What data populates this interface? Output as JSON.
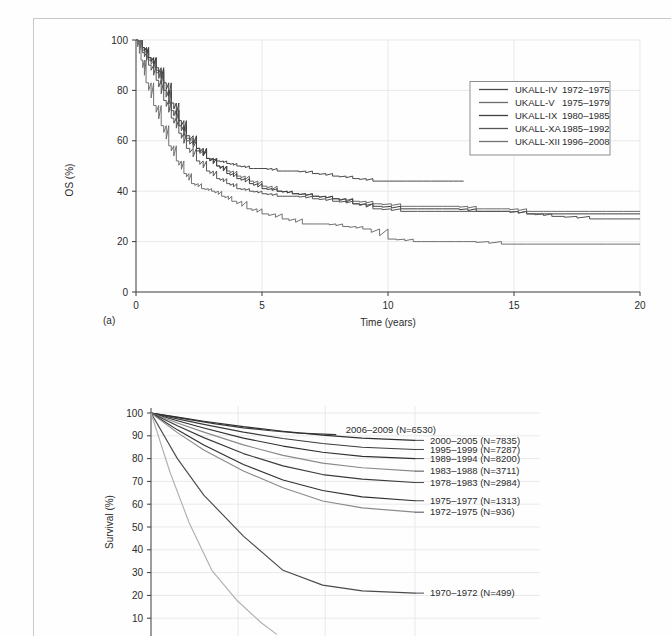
{
  "page": {
    "background": "#fefefe",
    "border_color": "#c9c9c9"
  },
  "figure_a": {
    "panel_label": "(a)",
    "xlabel": "Time (years)",
    "ylabel": "OS (%)",
    "legend": {
      "entries": [
        {
          "trial": "UKALL-IV",
          "period": "1972–1975",
          "color": "#4a4a4a"
        },
        {
          "trial": "UKALL-V",
          "period": "1975–1979",
          "color": "#6b6b6b"
        },
        {
          "trial": "UKALL-IX",
          "period": "1980–1985",
          "color": "#3f3f3f"
        },
        {
          "trial": "UKALL-XA",
          "period": "1985–1992",
          "color": "#555555"
        },
        {
          "trial": "UKALL-XII",
          "period": "1996–2008",
          "color": "#717171"
        }
      ]
    },
    "chart_data": {
      "type": "line",
      "title": "",
      "xlabel": "Time (years)",
      "ylabel": "OS (%)",
      "xlim": [
        0,
        20
      ],
      "ylim": [
        0,
        100
      ],
      "xticks": [
        0,
        5,
        10,
        15,
        20
      ],
      "yticks": [
        0,
        20,
        40,
        60,
        80,
        100
      ],
      "grid": "y-major-light",
      "legend_position": "upper-right",
      "series": [
        {
          "name": "UKALL-IV 1972–1975",
          "color": "#4a4a4a",
          "step": true,
          "x": [
            0,
            0.25,
            0.5,
            0.8,
            1.1,
            1.4,
            1.7,
            2.0,
            2.4,
            2.8,
            3.2,
            3.6,
            4.0,
            4.5,
            5.0,
            5.6,
            6.2,
            7.0,
            7.8,
            8.6,
            9.4,
            10.4,
            11.4,
            12.4,
            13.0
          ],
          "y": [
            100,
            97,
            93,
            88,
            80,
            72,
            66,
            60,
            56,
            53,
            52,
            51,
            50,
            49,
            49,
            48,
            48,
            47,
            46,
            45,
            44,
            44,
            44,
            44,
            44
          ]
        },
        {
          "name": "UKALL-V 1975–1979",
          "color": "#6b6b6b",
          "step": true,
          "x": [
            0,
            0.25,
            0.5,
            0.8,
            1.1,
            1.4,
            1.7,
            2.0,
            2.4,
            2.8,
            3.2,
            3.6,
            4.0,
            4.5,
            5.0,
            5.6,
            6.2,
            7.0,
            7.8,
            8.6,
            9.4,
            10.5,
            11.5,
            12.5,
            13.5,
            14.5,
            15.5,
            16.5,
            18.0,
            20.0
          ],
          "y": [
            100,
            96,
            92,
            87,
            80,
            72,
            66,
            61,
            57,
            53,
            50,
            48,
            46,
            44,
            42,
            40,
            39,
            38,
            37,
            36,
            35,
            34,
            34,
            34,
            33,
            33,
            32,
            32,
            32,
            32
          ]
        },
        {
          "name": "UKALL-IX 1980–1985",
          "color": "#3f3f3f",
          "step": true,
          "x": [
            0,
            0.25,
            0.5,
            0.8,
            1.1,
            1.4,
            1.7,
            2.0,
            2.4,
            2.8,
            3.2,
            3.6,
            4.0,
            4.5,
            5.0,
            5.6,
            6.2,
            7.0,
            7.8,
            8.6,
            9.4,
            10.5,
            11.5,
            12.5,
            13.5,
            14.5,
            15.5,
            16.5,
            18.0,
            20.0
          ],
          "y": [
            100,
            97,
            93,
            89,
            83,
            75,
            68,
            62,
            57,
            53,
            50,
            47,
            45,
            43,
            41,
            40,
            39,
            38,
            37,
            35,
            34,
            33,
            33,
            33,
            32,
            32,
            31,
            31,
            31,
            31
          ]
        },
        {
          "name": "UKALL-XA 1985–1992",
          "color": "#555555",
          "step": true,
          "x": [
            0,
            0.25,
            0.5,
            0.8,
            1.1,
            1.4,
            1.7,
            2.0,
            2.4,
            2.8,
            3.2,
            3.6,
            4.0,
            4.5,
            5.0,
            5.6,
            6.2,
            7.0,
            7.8,
            8.6,
            9.4,
            10.5,
            11.5,
            12.5,
            13.5,
            14.5,
            15.5,
            16.5,
            18.0,
            20.0
          ],
          "y": [
            100,
            95,
            90,
            84,
            76,
            69,
            63,
            57,
            52,
            48,
            45,
            43,
            41,
            40,
            39,
            38,
            38,
            37,
            36,
            35,
            33,
            32,
            32,
            32,
            32,
            32,
            31,
            30,
            29,
            29
          ]
        },
        {
          "name": "UKALL-XII 1996–2008",
          "color": "#717171",
          "step": true,
          "x": [
            0,
            0.2,
            0.4,
            0.7,
            1.0,
            1.3,
            1.6,
            1.9,
            2.2,
            2.6,
            3.0,
            3.4,
            3.8,
            4.4,
            5.0,
            5.8,
            6.6,
            7.4,
            8.2,
            9.0,
            10.0,
            11.0,
            12.0,
            13.0,
            14.5,
            16.0,
            18.0,
            20.0
          ],
          "y": [
            100,
            92,
            83,
            74,
            66,
            58,
            52,
            47,
            43,
            41,
            40,
            38,
            36,
            33,
            31,
            29,
            27,
            27,
            26,
            25,
            21,
            20,
            20,
            20,
            19,
            19,
            19,
            19
          ]
        }
      ]
    }
  },
  "figure_b": {
    "ylabel": "Survival (%)",
    "chart_data": {
      "type": "line",
      "title": "",
      "xlabel": "",
      "ylabel": "Survival (%)",
      "ylim": [
        0,
        100
      ],
      "yticks": [
        10,
        20,
        30,
        40,
        50,
        60,
        70,
        80,
        90,
        100
      ],
      "grid": "both-light",
      "legend_position": "right-inline-labels",
      "series": [
        {
          "name": "2006–2009 (N=6530)",
          "label": "2006–2009 (N=6530)",
          "n": 6530,
          "color": "#3b3b3b",
          "label_y": 90.5,
          "end_x_frac": 0.7,
          "x": [
            0,
            0.1,
            0.2,
            0.35,
            0.5,
            0.65,
            0.8,
            1.0
          ],
          "y": [
            100,
            98.6,
            97.2,
            95.2,
            93.5,
            92.2,
            91.2,
            90.5
          ]
        },
        {
          "name": "2000–2005 (N=7835)",
          "label": "2000–2005 (N=7835)",
          "n": 7835,
          "color": "#2f2f2f",
          "label_y": 88.0,
          "end_x_frac": 1.0,
          "x": [
            0,
            0.1,
            0.2,
            0.35,
            0.5,
            0.65,
            0.8,
            1.0
          ],
          "y": [
            100,
            98.2,
            96.4,
            94.0,
            92.0,
            90.3,
            89.0,
            88.0
          ]
        },
        {
          "name": "1995–1999 (N=7287)",
          "label": "1995–1999 (N=7287)",
          "n": 7287,
          "color": "#3b3b3b",
          "label_y": 84.0,
          "end_x_frac": 1.0,
          "x": [
            0,
            0.1,
            0.2,
            0.35,
            0.5,
            0.65,
            0.8,
            1.0
          ],
          "y": [
            100,
            97.4,
            95.0,
            91.6,
            88.8,
            86.6,
            85.0,
            84.0
          ]
        },
        {
          "name": "1989–1994 (N=8200)",
          "label": "1989–1994 (N=8200)",
          "n": 8200,
          "color": "#2f2f2f",
          "label_y": 80.0,
          "end_x_frac": 1.0,
          "x": [
            0,
            0.1,
            0.2,
            0.35,
            0.5,
            0.65,
            0.8,
            1.0
          ],
          "y": [
            100,
            96.6,
            93.4,
            89.0,
            85.5,
            82.8,
            81.0,
            80.0
          ]
        },
        {
          "name": "1983–1988 (N=3711)",
          "label": "1983–1988 (N=3711)",
          "n": 3711,
          "color": "#8a8a8a",
          "label_y": 74.5,
          "end_x_frac": 1.0,
          "x": [
            0,
            0.1,
            0.2,
            0.35,
            0.5,
            0.65,
            0.8,
            1.0
          ],
          "y": [
            100,
            95.6,
            91.6,
            86.0,
            81.4,
            78.0,
            76.0,
            74.5
          ]
        },
        {
          "name": "1978–1983 (N=2984)",
          "label": "1978–1983 (N=2984)",
          "n": 2984,
          "color": "#3b3b3b",
          "label_y": 69.5,
          "end_x_frac": 1.0,
          "x": [
            0,
            0.1,
            0.2,
            0.35,
            0.5,
            0.65,
            0.8,
            1.0
          ],
          "y": [
            100,
            94.4,
            89.2,
            82.2,
            76.8,
            73.0,
            71.0,
            69.5
          ]
        },
        {
          "name": "1975–1977 (N=1313)",
          "label": "1975–1977 (N=1313)",
          "n": 1313,
          "color": "#2f2f2f",
          "label_y": 61.5,
          "end_x_frac": 1.0,
          "x": [
            0,
            0.1,
            0.2,
            0.35,
            0.5,
            0.65,
            0.8,
            1.0
          ],
          "y": [
            100,
            92.6,
            86.0,
            77.4,
            70.6,
            66.0,
            63.2,
            61.5
          ]
        },
        {
          "name": "1972–1975 (N=936)",
          "label": "1972–1975 (N=936)",
          "n": 936,
          "color": "#8a8a8a",
          "label_y": 56.5,
          "end_x_frac": 1.0,
          "x": [
            0,
            0.1,
            0.2,
            0.35,
            0.5,
            0.65,
            0.8,
            1.0
          ],
          "y": [
            100,
            91.4,
            83.8,
            74.6,
            67.2,
            61.4,
            58.4,
            56.5
          ]
        },
        {
          "name": "1970–1972 (N=499)",
          "label": "1970–1972 (N=499)",
          "n": 499,
          "color": "#4a4a4a",
          "label_y": 21.0,
          "end_x_frac": 1.0,
          "x": [
            0,
            0.1,
            0.2,
            0.35,
            0.5,
            0.65,
            0.8,
            1.0
          ],
          "y": [
            100,
            80.0,
            64.0,
            46.0,
            31.0,
            24.5,
            22.0,
            21.0
          ]
        },
        {
          "name": "unlabelled-lowest",
          "label": "",
          "color": "#b0b0b0",
          "label_y": null,
          "end_x_frac": 0.72,
          "x": [
            0,
            0.1,
            0.2,
            0.32,
            0.45,
            0.58,
            0.66
          ],
          "y": [
            100,
            74.0,
            52.0,
            31.0,
            18.0,
            8.0,
            3.0
          ]
        }
      ]
    }
  }
}
